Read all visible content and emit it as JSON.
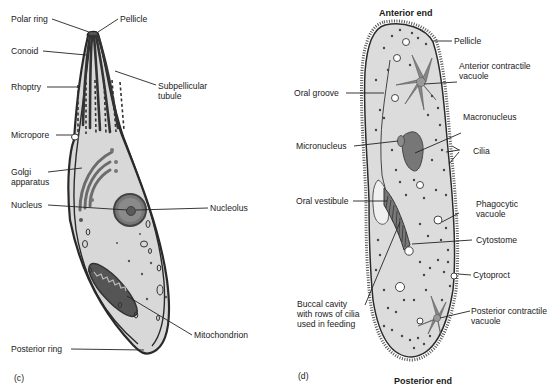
{
  "panel_c": {
    "panel_label": "(c)",
    "labels": {
      "polar_ring": "Polar ring",
      "pellicle": "Pellicle",
      "conoid": "Conoid",
      "rhoptry": "Rhoptry",
      "subpellicular_tubule_1": "Subpellicular",
      "subpellicular_tubule_2": "tubule",
      "micropore": "Micropore",
      "golgi_1": "Golgi",
      "golgi_2": "apparatus",
      "nucleus": "Nucleus",
      "nucleolus": "Nucleolus",
      "mitochondrion": "Mitochondrion",
      "posterior_ring": "Posterior ring"
    }
  },
  "panel_d": {
    "panel_label": "(d)",
    "anterior_end": "Anterior end",
    "posterior_end": "Posterior end",
    "labels": {
      "pellicle": "Pellicle",
      "anterior_cv_1": "Anterior contractile",
      "anterior_cv_2": "vacuole",
      "oral_groove": "Oral groove",
      "macronucleus": "Macronucleus",
      "micronucleus": "Micronucleus",
      "cilia": "Cilia",
      "oral_vestibule": "Oral vestibule",
      "phagocytic_1": "Phagocytic",
      "phagocytic_2": "vacuole",
      "cytostome": "Cytostome",
      "cytoproct": "Cytoproct",
      "buccal_1": "Buccal cavity",
      "buccal_2": "with rows of cilia",
      "buccal_3": "used in feeding",
      "posterior_cv_1": "Posterior contractile",
      "posterior_cv_2": "vacuole"
    }
  },
  "colors": {
    "cytoplasm": "#d9d9d9",
    "outline": "#2a2a2a",
    "organelle": "#7a7a7a",
    "dark": "#3c3c3c"
  }
}
